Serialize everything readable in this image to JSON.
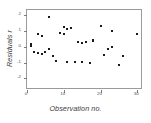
{
  "chart_data": {
    "type": "scatter",
    "title": "",
    "xlabel": "Observation no.",
    "ylabel": "Residuals r",
    "xlim": [
      0,
      31
    ],
    "ylim": [
      -2.6,
      2.3
    ],
    "xticks": [
      0,
      10,
      20,
      30
    ],
    "xticklabels": [
      "0",
      "10",
      "20",
      "30"
    ],
    "yticks": [
      2,
      1,
      0,
      -1,
      -2
    ],
    "yticklabels": [
      "2",
      "1",
      "0",
      "-1",
      "-2"
    ],
    "grid": false,
    "legend": null,
    "marker": "filled-square",
    "marker_color": "#1a1a1a",
    "points": [
      {
        "x": 1,
        "y": 0.18
      },
      {
        "x": 1,
        "y": 0.02
      },
      {
        "x": 2,
        "y": -0.32
      },
      {
        "x": 3,
        "y": 0.78
      },
      {
        "x": 3,
        "y": -0.42
      },
      {
        "x": 4,
        "y": 0.65
      },
      {
        "x": 4,
        "y": -0.48
      },
      {
        "x": 5,
        "y": -0.35
      },
      {
        "x": 6,
        "y": 1.85
      },
      {
        "x": 6,
        "y": -0.14
      },
      {
        "x": 7,
        "y": -0.6
      },
      {
        "x": 8,
        "y": -0.88
      },
      {
        "x": 9,
        "y": 0.88
      },
      {
        "x": 10,
        "y": 0.82
      },
      {
        "x": 10,
        "y": 1.22
      },
      {
        "x": 11,
        "y": 1.12
      },
      {
        "x": 11,
        "y": -0.98
      },
      {
        "x": 12,
        "y": 1.15
      },
      {
        "x": 13,
        "y": -0.96
      },
      {
        "x": 14,
        "y": 0.32
      },
      {
        "x": 15,
        "y": 0.22
      },
      {
        "x": 15,
        "y": -0.98
      },
      {
        "x": 16,
        "y": 0.3
      },
      {
        "x": 17,
        "y": -1.0
      },
      {
        "x": 18,
        "y": 0.42
      },
      {
        "x": 18,
        "y": 0.35
      },
      {
        "x": 20,
        "y": 1.28
      },
      {
        "x": 21,
        "y": -0.55
      },
      {
        "x": 22,
        "y": -0.18
      },
      {
        "x": 23,
        "y": 0.98
      },
      {
        "x": 23,
        "y": -0.05
      },
      {
        "x": 25,
        "y": -1.15
      },
      {
        "x": 26,
        "y": -0.62
      },
      {
        "x": 30,
        "y": 0.8
      }
    ]
  }
}
